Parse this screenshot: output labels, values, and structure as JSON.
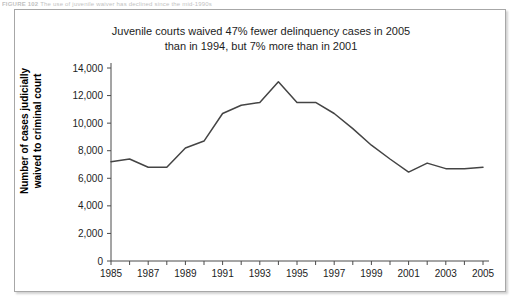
{
  "figure_header": {
    "label": "FIGURE 102",
    "text": "The use of juvenile waiver has declined since the mid-1990s"
  },
  "chart_data": {
    "type": "line",
    "title": "Juvenile courts waived 47% fewer delinquency cases in 2005 than in 1994, but 7% more than in 2001",
    "title_line1": "Juvenile courts waived 47% fewer delinquency cases in 2005",
    "title_line2": "than in 1994, but 7% more than in 2001",
    "xlabel": "",
    "ylabel": "Number of cases judicially waived to criminal court",
    "ylabel_line1": "Number of cases judicially",
    "ylabel_line2": "waived to criminal court",
    "ylim": [
      0,
      14000
    ],
    "ytick_values": [
      0,
      2000,
      4000,
      6000,
      8000,
      10000,
      12000,
      14000
    ],
    "ytick_labels": [
      "0",
      "2,000",
      "4,000",
      "6,000",
      "8,000",
      "10,000",
      "12,000",
      "14,000"
    ],
    "xlim": [
      1985,
      2005
    ],
    "xtick_values": [
      1985,
      1986,
      1987,
      1988,
      1989,
      1990,
      1991,
      1992,
      1993,
      1994,
      1995,
      1996,
      1997,
      1998,
      1999,
      2000,
      2001,
      2002,
      2003,
      2004,
      2005
    ],
    "xtick_labels": [
      "1985",
      "",
      "1987",
      "",
      "1989",
      "",
      "1991",
      "",
      "1993",
      "",
      "1995",
      "",
      "1997",
      "",
      "1999",
      "",
      "2001",
      "",
      "2003",
      "",
      "2005"
    ],
    "grid": false,
    "legend": false,
    "line_color": "#444444",
    "x": [
      1985,
      1986,
      1987,
      1988,
      1989,
      1990,
      1991,
      1992,
      1993,
      1994,
      1995,
      1996,
      1997,
      1998,
      1999,
      2000,
      2001,
      2002,
      2003,
      2004,
      2005
    ],
    "values": [
      7200,
      7400,
      6800,
      6800,
      8200,
      8700,
      10700,
      11300,
      11500,
      13000,
      11500,
      11500,
      10700,
      9600,
      8400,
      7400,
      6450,
      7100,
      6700,
      6700,
      6800
    ],
    "series": [
      {
        "name": "Cases judicially waived to criminal court",
        "values": [
          7200,
          7400,
          6800,
          6800,
          8200,
          8700,
          10700,
          11300,
          11500,
          13000,
          11500,
          11500,
          10700,
          9600,
          8400,
          7400,
          6450,
          7100,
          6700,
          6700,
          6800
        ]
      }
    ]
  }
}
